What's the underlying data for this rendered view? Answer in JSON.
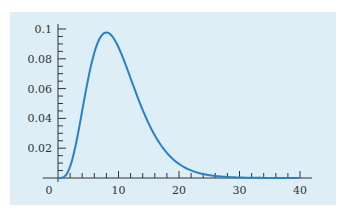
{
  "chart_data": {
    "type": "line",
    "title": "",
    "xlabel": "",
    "ylabel": "",
    "xlim": [
      0,
      40
    ],
    "ylim": [
      0,
      0.1
    ],
    "grid": false,
    "legend": null,
    "x_ticks_major": [
      0,
      10,
      20,
      30,
      40
    ],
    "x_tick_labels": [
      "0",
      "10",
      "20",
      "30",
      "40"
    ],
    "x_minor_step": 2,
    "y_ticks_major": [
      0.02,
      0.04,
      0.06,
      0.08,
      0.1
    ],
    "y_tick_labels": [
      "0.02",
      "0.04",
      "0.06",
      "0.08",
      "0.1"
    ],
    "y_minor_step": 0.005,
    "series": [
      {
        "name": "density",
        "color": "#2a7fc9",
        "x": [
          0,
          1,
          2,
          3,
          4,
          5,
          6,
          7,
          8,
          9,
          10,
          11,
          12,
          13,
          14,
          15,
          16,
          18,
          20,
          22,
          24,
          26,
          28,
          30,
          34,
          40
        ],
        "y": [
          0,
          0.0008,
          0.0077,
          0.0251,
          0.0451,
          0.0668,
          0.084,
          0.0941,
          0.0977,
          0.096,
          0.0877,
          0.0781,
          0.0669,
          0.0555,
          0.0447,
          0.0354,
          0.0276,
          0.016,
          0.0087,
          0.0046,
          0.0023,
          0.0011,
          0.0005,
          0.0002,
          0.0001,
          0.0
        ]
      }
    ],
    "background_color": "#ddeef7",
    "axis_color": "#333333"
  }
}
